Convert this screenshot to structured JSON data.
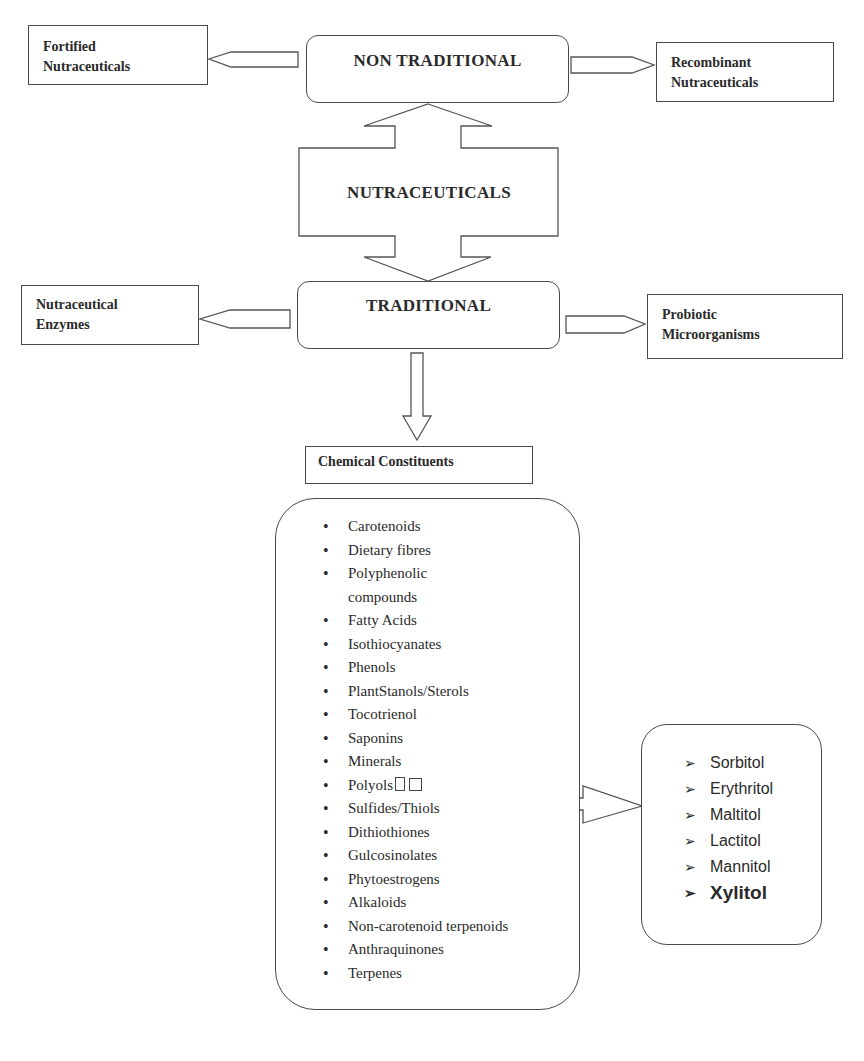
{
  "diagram": {
    "center": {
      "label": "NUTRACEUTICALS"
    },
    "non_traditional": {
      "label": "NON TRADITIONAL",
      "left": {
        "line1": "Fortified",
        "line2": "Nutraceuticals"
      },
      "right": {
        "line1": "Recombinant",
        "line2": "Nutraceuticals"
      }
    },
    "traditional": {
      "label": "TRADITIONAL",
      "left": {
        "line1": "Nutraceutical",
        "line2": "Enzymes"
      },
      "right": {
        "line1": "Probiotic",
        "line2": "Microorganisms"
      }
    },
    "chemical_constituents": {
      "title": "Chemical Constituents",
      "items": [
        "Carotenoids",
        "Dietary fibres",
        "Polyphenolic",
        "compounds",
        "Fatty Acids",
        "Isothiocyanates",
        "Phenols",
        "PlantStanols/Sterols",
        "Tocotrienol",
        "Saponins",
        "Minerals",
        "Polyols",
        "Sulfides/Thiols",
        "Dithiothiones",
        "Gulcosinolates",
        "Phytoestrogens",
        "Alkaloids",
        "Non-carotenoid terpenoids",
        "Anthraquinones",
        "Terpenes"
      ]
    },
    "polyols": {
      "items": [
        "Sorbitol",
        "Erythritol",
        "Maltitol",
        "Lactitol",
        "Mannitol",
        "Xylitol"
      ],
      "highlighted": "Xylitol"
    }
  }
}
